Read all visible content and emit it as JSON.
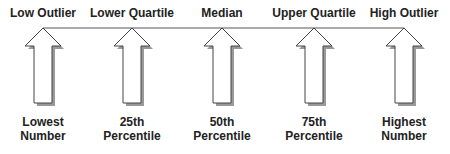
{
  "diagram": {
    "items": [
      {
        "top": "Low Outlier",
        "bottom_line1": "Lowest",
        "bottom_line2": "Number",
        "x": 43
      },
      {
        "top": "Lower Quartile",
        "bottom_line1": "25th",
        "bottom_line2": "Percentile",
        "x": 132
      },
      {
        "top": "Median",
        "bottom_line1": "50th",
        "bottom_line2": "Percentile",
        "x": 222
      },
      {
        "top": "Upper Quartile",
        "bottom_line1": "75th",
        "bottom_line2": "Percentile",
        "x": 314
      },
      {
        "top": "High Outlier",
        "bottom_line1": "Highest",
        "bottom_line2": "Number",
        "x": 404
      }
    ],
    "colors": {
      "line": "#555555",
      "shadow": "#999999",
      "arrow_fill": "#ffffff"
    }
  }
}
